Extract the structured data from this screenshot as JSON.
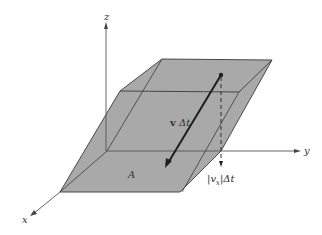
{
  "diagram": {
    "axes": {
      "z_label": "z",
      "y_label": "y",
      "x_label": "x"
    },
    "labels": {
      "area": "A",
      "velocity_vector": "v Δt",
      "velocity_bold": "v",
      "velocity_suffix": " Δt",
      "height_left": "|",
      "height_vx": "v",
      "height_sub": "x",
      "height_right": "|",
      "height_suffix": "Δt"
    },
    "colors": {
      "fill": "#a9a9a9",
      "edge": "#3a3a3a",
      "axis": "#555555",
      "arrow": "#1e1e1e"
    }
  }
}
